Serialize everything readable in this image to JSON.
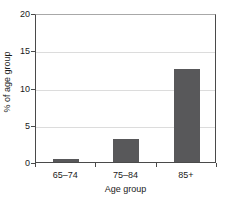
{
  "chart_data": {
    "type": "bar",
    "title": "",
    "categories": [
      "65–74",
      "75–84",
      "85+"
    ],
    "values": [
      0.4,
      3.1,
      12.5
    ],
    "series": [
      {
        "name": "% of age group",
        "values": [
          0.4,
          3.1,
          12.5
        ]
      }
    ],
    "xlabel": "Age group",
    "ylabel": "% of age group",
    "ylim": [
      0,
      20
    ],
    "yticks": [
      0,
      5,
      10,
      15,
      20
    ],
    "ytick_labels": [
      "0",
      "5",
      "10",
      "15",
      "20"
    ],
    "grid": true,
    "grid_axis": "y",
    "legend": false,
    "legend_position": "none",
    "bar_color": "#58585a",
    "gridline_color": "#dcdcdc",
    "axis_color": "#4a4a4a",
    "background_color": "#ffffff"
  }
}
